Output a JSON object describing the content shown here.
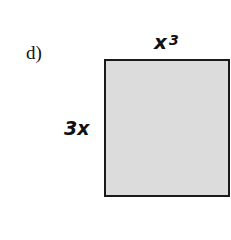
{
  "problem": {
    "part_label": "d)",
    "shape": "rectangle",
    "top_side": {
      "base": "x",
      "exponent": "3"
    },
    "left_side": "3x",
    "fill_color": "#dcdcdc",
    "stroke_color": "#1a1a1a"
  }
}
